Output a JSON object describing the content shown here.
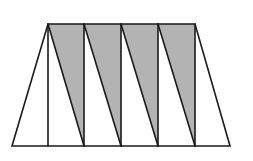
{
  "figure": {
    "stroke_color": "#1a1a1a",
    "shade_color": "#b3b3b3",
    "background": "#ffffff",
    "top_edge": {
      "y": 24,
      "x_start": 48,
      "x_end": 195
    },
    "bottom_edge": {
      "y": 146,
      "x_start": 12,
      "x_end": 230
    },
    "vertical_xs": [
      48,
      84,
      121,
      158,
      195
    ],
    "shaded_triangle_count": 4,
    "unshaded_region_count": 6
  }
}
